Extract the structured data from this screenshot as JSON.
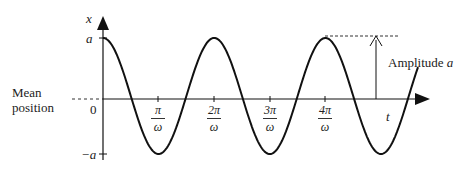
{
  "diagram": {
    "y_axis_label": "x",
    "x_axis_label": "t",
    "origin_label": "0",
    "y_ticks": [
      {
        "label": "a",
        "value": 1
      },
      {
        "label": "−a",
        "value": -1
      }
    ],
    "x_ticks": [
      {
        "num": "π",
        "den": "ω"
      },
      {
        "num": "2π",
        "den": "ω"
      },
      {
        "num": "3π",
        "den": "ω"
      },
      {
        "num": "4π",
        "den": "ω"
      }
    ],
    "mean_position_label": [
      "Mean",
      "position"
    ],
    "amplitude_label": "Amplitude",
    "amplitude_symbol": "a",
    "curve": {
      "function": "x = a cos(ωt)",
      "color": "#111111"
    }
  }
}
